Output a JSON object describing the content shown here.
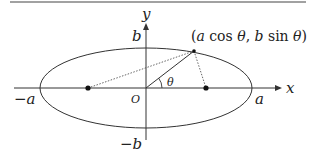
{
  "diagram": {
    "axes": {
      "x_label": "x",
      "y_label": "y",
      "origin_label": "O"
    },
    "ticks": {
      "pos_a": "a",
      "neg_a": "−a",
      "pos_b": "b",
      "neg_b": "−b"
    },
    "point_label_parts": {
      "open": "(",
      "a": "a",
      "cos": " cos ",
      "theta1": "θ",
      "comma": ", ",
      "b": "b",
      "sin": " sin ",
      "theta2": "θ",
      "close": ")"
    },
    "angle_label": "θ",
    "elements": {
      "ellipse": {
        "cx": 146,
        "cy": 88,
        "rx": 106,
        "ry": 40
      },
      "foci": [
        {
          "x": 88,
          "y": 88
        },
        {
          "x": 206,
          "y": 88
        }
      ],
      "point": {
        "x": 194,
        "y": 51
      }
    },
    "colors": {
      "line": "#333333",
      "dotted": "#555555"
    }
  }
}
